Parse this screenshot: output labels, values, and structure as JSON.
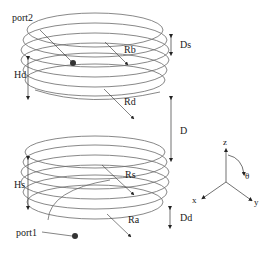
{
  "diagram": {
    "type": "two-coil helical antenna geometry",
    "upper_coil": {
      "port_label": "port2",
      "radius_labels": [
        "Rb",
        "Rd"
      ],
      "height_label": "Hd",
      "spacing_label": "Ds",
      "turns": 5
    },
    "lower_coil": {
      "port_label": "port1",
      "radius_labels": [
        "Rs",
        "Ra"
      ],
      "height_label": "Hs",
      "spacing_label": "Dd",
      "turns": 5
    },
    "separation_label": "D",
    "axes": {
      "z": "z",
      "x": "x",
      "y": "y",
      "angle": "θ"
    },
    "colors": {
      "stroke": "#6a6a6a",
      "text": "#222222",
      "background": "#ffffff"
    }
  }
}
